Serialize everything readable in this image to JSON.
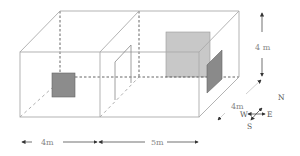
{
  "diagram": {
    "rooms": [
      {
        "name": "left-room",
        "width_label": "4m"
      },
      {
        "name": "right-room",
        "width_label": "5m"
      }
    ],
    "dimensions": {
      "left_width": "4m",
      "right_width": "5m",
      "depth": "4m",
      "height": "4 m"
    },
    "compass": {
      "north": "N",
      "east": "E",
      "south": "S",
      "west": "W"
    },
    "colors": {
      "edge": "#aaaaaa",
      "dashed": "#555555",
      "window_dark": "#8c8c8c",
      "window_light": "#c8c8c8",
      "side_window": "#8a8a8a",
      "label": "#888888"
    }
  }
}
